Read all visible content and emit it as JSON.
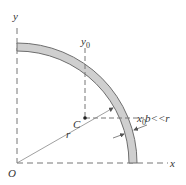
{
  "diagram": {
    "type": "geometry",
    "labels": {
      "y_axis": "y",
      "x_axis": "x",
      "origin": "O",
      "centroid": "C",
      "y0_main": "y",
      "y0_sub": "0",
      "x0_main": "x",
      "x0_sub": "0",
      "radius": "r",
      "thickness": "b<<r"
    },
    "colors": {
      "ring_fill": "#cfcfcf",
      "ring_stroke": "#6e6e6e",
      "axis": "#777777",
      "text": "#333333"
    }
  }
}
